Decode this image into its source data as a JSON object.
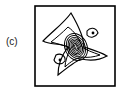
{
  "figure": {
    "panel_label": "(c)",
    "type": "contour plot"
  }
}
